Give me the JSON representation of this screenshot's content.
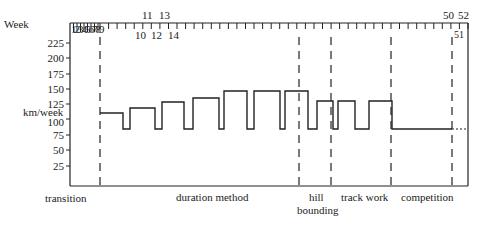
{
  "chart_data": {
    "type": "line",
    "subtype": "step",
    "title": "",
    "xlabel": "Week",
    "ylabel": "km/week",
    "ylim": [
      0,
      225
    ],
    "y_ticks": [
      25,
      50,
      75,
      100,
      125,
      150,
      175,
      200,
      225
    ],
    "x_tick_labels_top": [
      "11",
      "13",
      "50",
      "52"
    ],
    "x_tick_labels_bottom": [
      "10",
      "12",
      "14",
      "51"
    ],
    "x_tick_labels_boxed": [
      "1",
      "2",
      "3",
      "4",
      "5",
      "6",
      "7",
      "8",
      "9"
    ],
    "grid": false,
    "phases": [
      {
        "name": "transition",
        "weeks": "1-4"
      },
      {
        "name": "duration method",
        "weeks": "5-28"
      },
      {
        "name": "hill bounding",
        "weeks": "29-32"
      },
      {
        "name": "track work",
        "weeks": "33-39"
      },
      {
        "name": "competition",
        "weeks": "40-52"
      }
    ],
    "series": [
      {
        "name": "km/week",
        "steps": [
          {
            "from_week": 5,
            "to_week": 7,
            "value": 110
          },
          {
            "from_week": 8,
            "to_week": 8,
            "value": 85
          },
          {
            "from_week": 9,
            "to_week": 11,
            "value": 118
          },
          {
            "from_week": 12,
            "to_week": 12,
            "value": 85
          },
          {
            "from_week": 13,
            "to_week": 15,
            "value": 128
          },
          {
            "from_week": 16,
            "to_week": 16,
            "value": 85
          },
          {
            "from_week": 17,
            "to_week": 19,
            "value": 135
          },
          {
            "from_week": 20,
            "to_week": 20,
            "value": 85
          },
          {
            "from_week": 21,
            "to_week": 23,
            "value": 145
          },
          {
            "from_week": 24,
            "to_week": 24,
            "value": 85
          },
          {
            "from_week": 25,
            "to_week": 27,
            "value": 145
          },
          {
            "from_week": 28,
            "to_week": 28,
            "value": 85
          },
          {
            "from_week": 29,
            "to_week": 31,
            "value": 145
          },
          {
            "from_week": 32,
            "to_week": 32,
            "value": 85
          },
          {
            "from_week": 33,
            "to_week": 34,
            "value": 128
          },
          {
            "from_week": 35,
            "to_week": 35,
            "value": 85
          },
          {
            "from_week": 36,
            "to_week": 37,
            "value": 128
          },
          {
            "from_week": 38,
            "to_week": 39,
            "value": 85
          },
          {
            "from_week": 40,
            "to_week": 42,
            "value": 128
          },
          {
            "from_week": 43,
            "to_week": 50,
            "value": 87
          },
          {
            "from_week": 51,
            "to_week": 52,
            "value": 87,
            "style": "dotted"
          }
        ]
      }
    ]
  },
  "labels": {
    "week": "Week",
    "ylabel": "km/week",
    "y_ticks": [
      "225",
      "200",
      "175",
      "150",
      "125",
      "100",
      "75",
      "50",
      "25"
    ],
    "boxed_weeks": [
      "1",
      "2",
      "3",
      "4",
      "5",
      "6",
      "7",
      "8",
      "9"
    ],
    "w11": "11",
    "w13": "13",
    "w10": "10",
    "w12": "12",
    "w14": "14",
    "w50": "50",
    "w52": "52",
    "w51": "51",
    "phase_transition": "transition",
    "phase_duration": "duration method",
    "phase_hill_1": "hill",
    "phase_hill_2": "bounding",
    "phase_track": "track work",
    "phase_competition": "competition"
  }
}
